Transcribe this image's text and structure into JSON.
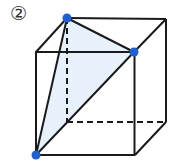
{
  "figure": {
    "label": "②",
    "colors": {
      "edge": "#1a1a1a",
      "vertex_dot": "#1f5fd6",
      "section_fill": "#e6f1fb"
    },
    "vertices": {
      "back_top_left": [
        67,
        18
      ],
      "back_top_right": [
        166,
        19
      ],
      "front_top_left": [
        36,
        52
      ],
      "front_top_right": [
        134,
        52
      ],
      "front_bottom_left": [
        36,
        155
      ],
      "front_bottom_right": [
        135,
        155
      ],
      "back_bottom_right": [
        166,
        122
      ],
      "back_bottom_left": [
        67,
        122
      ]
    },
    "highlighted_vertices": [
      "back_top_left",
      "front_top_right",
      "front_bottom_left"
    ],
    "cross_section": {
      "shape": "triangle",
      "points": [
        "back_top_left",
        "front_top_right",
        "front_bottom_left"
      ]
    },
    "hidden_edges": [
      [
        "back_top_left",
        "back_bottom_left"
      ],
      [
        "back_bottom_left",
        "back_bottom_right"
      ]
    ]
  }
}
